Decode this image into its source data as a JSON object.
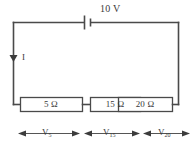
{
  "figure": {
    "name": "series-circuit-diagram",
    "type": "electrical-schematic",
    "background_color": "#ffffff",
    "line_color": "#4a4a4a",
    "text_color": "#3a3a3a"
  },
  "source": {
    "label": "10 V",
    "symbol": "battery-cell",
    "voltage_value": 10,
    "unit": "V"
  },
  "current": {
    "label": "I",
    "direction": "down",
    "arrow": "down-arrow-icon"
  },
  "resistors": [
    {
      "label": "5 Ω",
      "value": 5,
      "unit": "Ω"
    },
    {
      "label": "15 Ω",
      "value": 15,
      "unit": "Ω"
    },
    {
      "label": "20 Ω",
      "value": 20,
      "unit": "Ω"
    }
  ],
  "voltage_drops": [
    {
      "symbol": "V",
      "subscript": "5"
    },
    {
      "symbol": "V",
      "subscript": "15"
    },
    {
      "symbol": "V",
      "subscript": "20"
    }
  ]
}
